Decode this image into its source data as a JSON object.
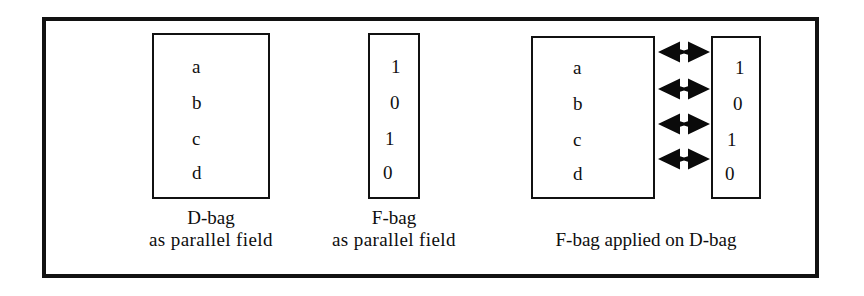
{
  "figure": {
    "background_color": "#ffffff",
    "ink_color": "#111111",
    "frame": {
      "border_color": "#121212",
      "border_width_px": 4
    },
    "groups": [
      {
        "id": "d-bag-parallel-field",
        "box": {
          "name": "d-bag-box",
          "items": [
            "a",
            "b",
            "c",
            "d"
          ]
        },
        "caption": {
          "line1": "D-bag",
          "line2": "as parallel  field"
        }
      },
      {
        "id": "f-bag-parallel-field",
        "box": {
          "name": "f-bag-box",
          "items": [
            "1",
            "0",
            "1",
            "0"
          ]
        },
        "caption": {
          "line1": "F-bag",
          "line2": "as parallel  field"
        }
      },
      {
        "id": "f-bag-applied-on-d-bag",
        "left_box": {
          "name": "applied-d-bag-box",
          "items": [
            "a",
            "b",
            "c",
            "d"
          ]
        },
        "right_box": {
          "name": "applied-f-bag-box",
          "items": [
            "1",
            "0",
            "1",
            "0"
          ]
        },
        "connectors": {
          "name": "double-headed-arrow",
          "count": 4,
          "glyph": "double-headed-arrow-icon"
        },
        "caption": {
          "line1": "F-bag applied on D-bag",
          "line2": ""
        }
      }
    ]
  }
}
